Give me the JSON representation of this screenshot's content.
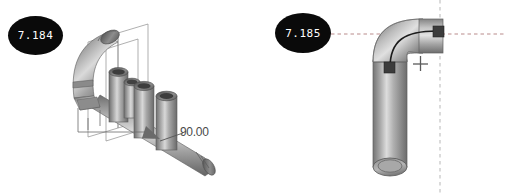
{
  "page": {
    "background_color": "#ffffff",
    "width": 506,
    "height": 195,
    "content_type": "engineering-cad-figure-pair"
  },
  "figures": [
    {
      "id": "fig-left",
      "number_label": "7.184",
      "badge": {
        "shape": "ellipse",
        "fill_color": "#0a0a0a",
        "text_color": "#ffffff"
      },
      "subject": "3d-pipe-manifold-assembly",
      "annotations": [
        {
          "name": "angle-dimension",
          "text": "90.00"
        }
      ],
      "geometry_notes": {
        "elbow_count": 2,
        "branch_stack_count": 3,
        "datum_plane_count": 2,
        "has_dimension_arrow": true,
        "pipe_fill_color": "#9a9a9a",
        "pipe_highlight_color": "#d2d2d2",
        "pipe_shadow_color": "#6b6b6b",
        "wireframe_color": "#8e8e8e"
      }
    },
    {
      "id": "fig-right",
      "number_label": "7.185",
      "badge": {
        "shape": "ellipse",
        "fill_color": "#0a0a0a",
        "text_color": "#ffffff"
      },
      "subject": "3d-pipe-elbow-with-centerline",
      "annotations": [],
      "geometry_notes": {
        "elbow_count": 1,
        "endpoint_marker_count": 2,
        "endpoint_marker_color": "#3c3c3c",
        "centerline_color": "#1c1c1c",
        "crosshair_marker": "+",
        "crosshair_color": "#5a5a5a",
        "dashed_horizontal_color": "#b98c8c",
        "dashed_vertical_color": "#c4c4c4",
        "pipe_fill_color": "#9a9a9a",
        "pipe_highlight_color": "#d2d2d2",
        "pipe_shadow_color": "#6b6b6b"
      }
    }
  ]
}
